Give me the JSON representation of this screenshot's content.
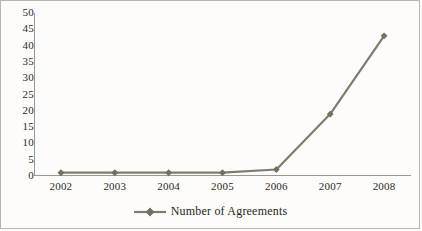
{
  "chart_data": {
    "type": "line",
    "title": "",
    "xlabel": "",
    "ylabel": "",
    "categories": [
      "2002",
      "2003",
      "2004",
      "2005",
      "2006",
      "2007",
      "2008"
    ],
    "values": [
      1,
      1,
      1,
      1,
      2,
      19,
      43
    ],
    "series": [
      {
        "name": "Number of Agreements",
        "values": [
          1,
          1,
          1,
          1,
          2,
          19,
          43
        ]
      }
    ],
    "ylim": [
      0,
      50
    ],
    "yticks": [
      0,
      5,
      10,
      15,
      20,
      25,
      30,
      35,
      40,
      45,
      50
    ],
    "ytick_labels": [
      "0",
      "5",
      "10",
      "15",
      "20",
      "25",
      "30",
      "35",
      "40",
      "45",
      "50"
    ],
    "grid": "horizontal",
    "legend_position": "bottom",
    "marker": "diamond",
    "colors": {
      "series_line": "#7d7d6e",
      "marker": "#71715f",
      "gridline": "#d8cfcb",
      "axis": "#9c988f",
      "text": "#2b2b28",
      "background": "#fdfcfa",
      "border": "#b9b5ad"
    }
  },
  "legend": {
    "entries": [
      {
        "label": "Number of Agreements",
        "marker": "diamond-line-marker"
      }
    ]
  }
}
